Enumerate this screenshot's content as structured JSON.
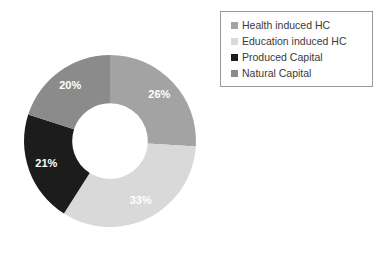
{
  "chart_data": {
    "type": "pie",
    "variant": "donut",
    "title": "",
    "xlabel": "",
    "ylabel": "",
    "grid": false,
    "legend_position": "top-right",
    "start_angle_deg": 0,
    "direction": "clockwise",
    "inner_radius_ratio": 0.44,
    "categories": [
      "Health induced HC",
      "Education induced HC",
      "Produced Capital",
      "Natural Capital"
    ],
    "values": [
      26,
      33,
      21,
      20
    ],
    "value_unit": "%",
    "data_labels": [
      "26%",
      "33%",
      "21%",
      "20%"
    ],
    "colors": [
      "#a3a3a3",
      "#d9d9d9",
      "#1c1c1c",
      "#8b8b8b"
    ],
    "label_color": "#ffffff",
    "slices": [
      {
        "label": "Health induced HC",
        "value": 26,
        "display": "26%",
        "color": "#a3a3a3"
      },
      {
        "label": "Education induced HC",
        "value": 33,
        "display": "33%",
        "color": "#d9d9d9"
      },
      {
        "label": "Produced Capital",
        "value": 21,
        "display": "21%",
        "color": "#1c1c1c"
      },
      {
        "label": "Natural Capital",
        "value": 20,
        "display": "20%",
        "color": "#8b8b8b"
      }
    ]
  },
  "legend": {
    "border_color": "#9a9a9a",
    "items": [
      {
        "label": "Health induced HC",
        "color": "#a3a3a3"
      },
      {
        "label": "Education induced HC",
        "color": "#d9d9d9"
      },
      {
        "label": "Produced Capital",
        "color": "#1c1c1c"
      },
      {
        "label": "Natural Capital",
        "color": "#8b8b8b"
      }
    ]
  }
}
